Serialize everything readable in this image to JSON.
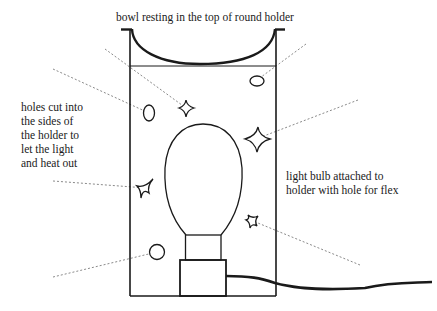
{
  "diagram": {
    "title": "bowl resting in the top of round holder",
    "labels": {
      "left": {
        "lines": [
          "holes cut into",
          "the sides of",
          "the holder to",
          "let the light",
          "and heat out"
        ]
      },
      "right": {
        "lines": [
          "light bulb attached to",
          "holder with hole for flex"
        ]
      }
    },
    "parts": [
      "bowl",
      "round holder",
      "holes (ovals, stars, circle)",
      "light bulb",
      "bulb socket",
      "flex cable"
    ],
    "colors": {
      "line": "#1a1a1a",
      "leader": "#888888",
      "background": "#ffffff"
    }
  }
}
